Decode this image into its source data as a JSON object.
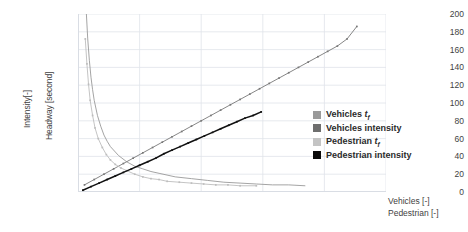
{
  "chart_data": {
    "type": "line",
    "title": "",
    "subtitle": "",
    "xlabel": "Vehicles [-] / Pedestrian [-]",
    "ylabel": "Intensity[-] / Headway [second]",
    "ylim": [
      0,
      200
    ],
    "xlim": [
      0,
      38
    ],
    "grid": true,
    "legend_position": "right-inside",
    "y_ticks": [
      200,
      180,
      160,
      140,
      120,
      100,
      80,
      60,
      40,
      20,
      0
    ],
    "x_ticks": [],
    "series": [
      {
        "name": "Vehicles tf",
        "color": "#9a9a9a",
        "axis": "headway",
        "marker": "none",
        "x": [
          1.0,
          1.2,
          1.4,
          1.6,
          1.8,
          2.0,
          2.4,
          2.8,
          3.2,
          3.6,
          4.0,
          5.0,
          6.0,
          7.0,
          8.0,
          9.0,
          10.0,
          12.0,
          14.0,
          16.0,
          18.0,
          20.0,
          22.0,
          24.0,
          26.0,
          28.0
        ],
        "y": [
          206,
          172,
          148,
          129,
          115,
          103,
          86,
          74,
          64,
          57,
          51,
          41,
          34,
          29,
          26,
          23,
          21,
          17,
          15,
          13,
          11,
          10,
          9,
          8,
          8,
          7
        ]
      },
      {
        "name": "Vehicles intensity",
        "color": "#787878",
        "axis": "intensity",
        "marker": "dot",
        "x": [
          0.8,
          2.0,
          3.2,
          4.4,
          5.6,
          6.8,
          8.0,
          9.2,
          10.4,
          11.6,
          12.8,
          14.0,
          15.2,
          16.4,
          17.6,
          18.8,
          20.0,
          21.2,
          22.4,
          23.6,
          24.8,
          26.0,
          27.2,
          28.4,
          29.6,
          30.8,
          32.0,
          33.2,
          34.4
        ],
        "y": [
          8,
          14,
          20,
          26,
          32,
          38,
          44,
          50,
          56,
          62,
          68,
          74,
          80,
          86,
          92,
          98,
          104,
          110,
          116,
          122,
          128,
          134,
          140,
          146,
          152,
          158,
          164,
          172,
          186
        ]
      },
      {
        "name": "Pedestrian tf",
        "color": "#bdbdbd",
        "axis": "headway",
        "marker": "dot",
        "x": [
          0.9,
          1.1,
          1.3,
          1.5,
          1.8,
          2.1,
          2.5,
          3.0,
          3.5,
          4.0,
          4.6,
          5.3,
          6.0,
          7.0,
          8.0,
          9.0,
          10.0,
          11.0,
          12.5,
          14.0,
          15.5,
          17.0,
          18.5,
          20.0,
          22.0
        ],
        "y": [
          172,
          144,
          121,
          103,
          86,
          72,
          60,
          50,
          42,
          36,
          31,
          27,
          24,
          20,
          17,
          15,
          14,
          12,
          11,
          10,
          9,
          8,
          8,
          7,
          7
        ]
      },
      {
        "name": "Pedestrian intensity",
        "color": "#111111",
        "axis": "intensity",
        "marker": "dot",
        "x": [
          0.6,
          1.6,
          2.6,
          3.6,
          4.6,
          5.6,
          6.6,
          7.6,
          8.6,
          9.6,
          10.6,
          11.6,
          12.6,
          13.6,
          14.6,
          15.6,
          16.6,
          17.6,
          18.6,
          19.6,
          20.6,
          21.6,
          22.6
        ],
        "y": [
          2,
          6,
          10,
          14,
          18,
          22,
          26,
          30,
          34,
          38,
          43,
          47,
          51,
          55,
          59,
          63,
          67,
          71,
          75,
          79,
          83,
          86,
          90
        ]
      }
    ]
  },
  "axes": {
    "y_title_primary": "Intensity[-]",
    "y_title_secondary": "Headway [second]",
    "x_title_primary": "Vehicles [-]",
    "x_title_secondary": "Pedestrian [-]",
    "y_tick_labels": [
      "200",
      "180",
      "160",
      "140",
      "120",
      "100",
      "80",
      "60",
      "40",
      "20",
      "0"
    ]
  },
  "legend": {
    "items": [
      {
        "label": "Vehicles",
        "italic": "t",
        "subscript": "f",
        "color": "#9a9a9a"
      },
      {
        "label": "Vehicles intensity",
        "italic": "",
        "subscript": "",
        "color": "#6e6e6e"
      },
      {
        "label": "Pedestrian",
        "italic": "t",
        "subscript": "f",
        "color": "#c4c4c4"
      },
      {
        "label": "Pedestrian intensity",
        "italic": "",
        "subscript": "",
        "color": "#0a0a0a"
      }
    ]
  },
  "colors": {
    "grid": "#dfe3ea",
    "plot_border": "#d9dde4",
    "text": "#3f3f3f",
    "background": "#ffffff"
  }
}
